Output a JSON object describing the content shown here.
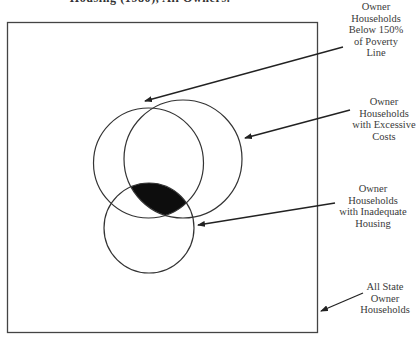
{
  "title": "Housing (1980), All Owners.",
  "colors": {
    "stroke": "#333333",
    "fill_intersection": "#0d0d0d",
    "background": "#ffffff"
  },
  "universe": {
    "label_lines": [
      "All State",
      "Owner",
      "Households"
    ]
  },
  "sets": [
    {
      "id": "poverty",
      "label_lines": [
        "Owner",
        "Households",
        "Below 150%",
        "of Poverty",
        "Line"
      ]
    },
    {
      "id": "excessive-costs",
      "label_lines": [
        "Owner",
        "Households",
        "with Excessive",
        "Costs"
      ]
    },
    {
      "id": "inadequate-housing",
      "label_lines": [
        "Owner",
        "Households",
        "with Inadequate",
        "Housing"
      ]
    }
  ],
  "highlighted_region": "intersection of all three sets (filled black)"
}
